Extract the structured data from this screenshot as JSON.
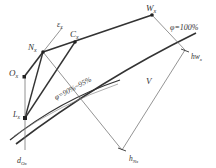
{
  "diagram": {
    "points": {
      "W": {
        "label": "W",
        "sub": "x"
      },
      "C": {
        "label": "C",
        "sub": "x"
      },
      "N": {
        "label": "N",
        "sub": "x"
      },
      "O": {
        "label": "O",
        "sub": "x"
      },
      "L": {
        "label": "L",
        "sub": "x"
      }
    },
    "epsilon": {
      "label": "ε",
      "sub": "x"
    },
    "curve_upper": {
      "label": "φ=100%"
    },
    "curve_lower": {
      "label": "φ=90%~95%"
    },
    "dimension": {
      "label": "V"
    },
    "h_w": {
      "label": "hw",
      "sub": "x"
    },
    "h_n": {
      "label": "h",
      "sub": "Nx"
    },
    "d_o": {
      "label": "d",
      "sub": "Ox"
    },
    "colors": {
      "line": "#333333",
      "thin_line": "#666666",
      "background": "#ffffff"
    }
  }
}
